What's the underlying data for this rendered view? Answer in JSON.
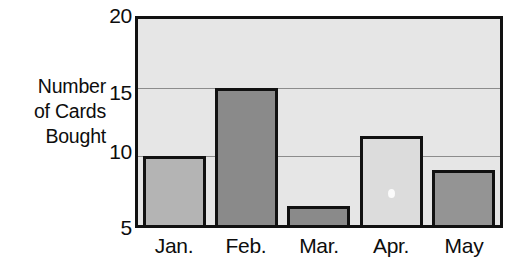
{
  "chart_data": {
    "type": "bar",
    "title": "",
    "subtitle": "",
    "xlabel": "",
    "ylabel": "Number of Cards Bought",
    "ylabel_lines": [
      "Number",
      "of Cards",
      "Bought"
    ],
    "categories": [
      "Jan.",
      "Feb.",
      "Mar.",
      "Apr.",
      "May"
    ],
    "values": [
      10,
      15,
      6.4,
      11.5,
      9
    ],
    "ylim": [
      5,
      20
    ],
    "yticks": [
      5,
      10,
      15,
      20
    ],
    "ytick_labels": [
      "5",
      "10",
      "15",
      "20"
    ],
    "gridlines": [
      10,
      15
    ],
    "grid": true,
    "legend": false,
    "bar_fills": [
      "#b4b4b4",
      "#8a8a8a",
      "#8a8a8a",
      "#dcdcdc",
      "#949494"
    ],
    "bar_edge_color": "#111111",
    "plot_background": "#e6e6e6",
    "page_background": "#ffffff",
    "text_color": "#0d0d0d",
    "gridline_color": "#8c8c8c"
  },
  "axis": {
    "y_ticks": [
      {
        "label": "20",
        "name": "y-tick-20"
      },
      {
        "label": "15",
        "name": "y-tick-15"
      },
      {
        "label": "10",
        "name": "y-tick-10"
      },
      {
        "label": "5",
        "name": "y-tick-5"
      }
    ]
  },
  "y_title": {
    "line1": "Number",
    "line2": "of Cards",
    "line3": "Bought",
    "full": "Number\nof Cards\nBought"
  },
  "x_labels": {
    "jan": "Jan.",
    "feb": "Feb.",
    "mar": "Mar.",
    "apr": "Apr.",
    "may": "May"
  }
}
